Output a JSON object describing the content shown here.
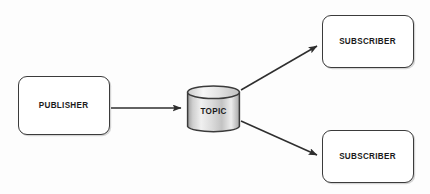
{
  "diagram": {
    "type": "flow-diagram",
    "background_color": "#fdfdfd",
    "stroke_color": "#3b3b3b",
    "text_color": "#1a1a1a",
    "cylinder_fill_light": "#f2f2f2",
    "cylinder_fill_mid": "#c9c9c9",
    "cylinder_fill_dark": "#9a9a9a",
    "nodes": [
      {
        "id": "publisher",
        "label": "PUBLISHER",
        "shape": "rounded-rectangle",
        "x": 18,
        "y": 76,
        "width": 92,
        "height": 59
      },
      {
        "id": "topic",
        "label": "TOPIC",
        "shape": "cylinder",
        "x": 186,
        "y": 85,
        "width": 55,
        "height": 49
      },
      {
        "id": "subscriber-top",
        "label": "SUBSCRIBER",
        "shape": "rounded-rectangle",
        "x": 322,
        "y": 15,
        "width": 92,
        "height": 53
      },
      {
        "id": "subscriber-bottom",
        "label": "SUBSCRIBER",
        "shape": "rounded-rectangle",
        "x": 322,
        "y": 130,
        "width": 92,
        "height": 53
      }
    ],
    "edges": [
      {
        "id": "publisher-to-topic",
        "from": "publisher",
        "to": "topic",
        "label": "",
        "arrowhead": "filled-triangle",
        "x1": 111,
        "y1": 108,
        "x2": 184,
        "y2": 108
      },
      {
        "id": "topic-to-subscriber-top",
        "from": "topic",
        "to": "subscriber-top",
        "label": "",
        "arrowhead": "filled-triangle",
        "x1": 241,
        "y1": 90,
        "x2": 320,
        "y2": 44
      },
      {
        "id": "topic-to-subscriber-bottom",
        "from": "topic",
        "to": "subscriber-bottom",
        "label": "",
        "arrowhead": "filled-triangle",
        "x1": 241,
        "y1": 121,
        "x2": 320,
        "y2": 157
      }
    ]
  }
}
